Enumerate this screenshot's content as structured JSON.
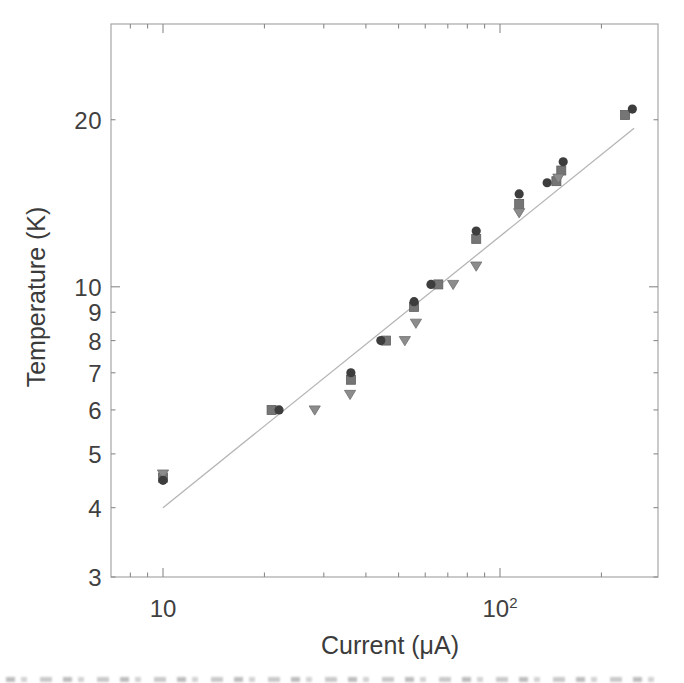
{
  "figure": {
    "xlabel": "Current (μA)",
    "ylabel": "Temperature (K)",
    "background_color": "#ffffff",
    "text_color": "#3b3b3b",
    "spine_color": "#9e9e9e",
    "tick_color": "#8a8a8a"
  },
  "axes": {
    "x": {
      "scale": "log",
      "major_ticks": [
        10,
        100
      ],
      "minor_ticks": [
        8,
        9,
        20,
        30,
        40,
        50,
        60,
        70,
        80,
        90,
        200
      ],
      "tick_labels": [
        {
          "value": 10,
          "text": "10",
          "sup": ""
        },
        {
          "value": 100,
          "text": "10",
          "sup": "2"
        }
      ]
    },
    "y": {
      "scale": "log",
      "major_ticks": [
        10
      ],
      "minor_ticks": [
        3,
        4,
        5,
        6,
        7,
        8,
        9,
        20
      ],
      "tick_labels": [
        {
          "value": 20,
          "text": "20"
        },
        {
          "value": 10,
          "text": "10"
        },
        {
          "value": 9,
          "text": "9"
        },
        {
          "value": 8,
          "text": "8"
        },
        {
          "value": 7,
          "text": "7"
        },
        {
          "value": 6,
          "text": "6"
        },
        {
          "value": 5,
          "text": "5"
        },
        {
          "value": 4,
          "text": "4"
        },
        {
          "value": 3,
          "text": "3"
        }
      ]
    }
  },
  "chart_data": {
    "type": "scatter",
    "title": "",
    "xlabel": "Current (μA)",
    "ylabel": "Temperature (K)",
    "x_scale": "log",
    "y_scale": "log",
    "xlim": [
      7,
      300
    ],
    "ylim": [
      3,
      30
    ],
    "grid": false,
    "legend": "none",
    "series": [
      {
        "name": "circle-markers",
        "marker": "circle",
        "color": "#3d3d3d",
        "points": [
          [
            10.0,
            4.48
          ],
          [
            22.1,
            6.0
          ],
          [
            36.1,
            7.0
          ],
          [
            44.3,
            8.0
          ],
          [
            55.6,
            9.4
          ],
          [
            62.4,
            10.1
          ],
          [
            85.0,
            12.6
          ],
          [
            114.0,
            14.7
          ],
          [
            138.0,
            15.4
          ],
          [
            154.0,
            16.8
          ],
          [
            247.0,
            20.9
          ]
        ]
      },
      {
        "name": "square-markers",
        "marker": "square",
        "color": "#757575",
        "points": [
          [
            10.0,
            4.53
          ],
          [
            21.0,
            6.0
          ],
          [
            36.1,
            6.8
          ],
          [
            45.9,
            8.0
          ],
          [
            55.6,
            9.2
          ],
          [
            65.6,
            10.1
          ],
          [
            85.0,
            12.2
          ],
          [
            114.0,
            14.1
          ],
          [
            147.0,
            15.5
          ],
          [
            152.0,
            16.2
          ],
          [
            235.0,
            20.4
          ]
        ]
      },
      {
        "name": "triangle-down-markers",
        "marker": "triangle-down",
        "color": "#8c8c8c",
        "points": [
          [
            10.0,
            4.6
          ],
          [
            28.2,
            6.0
          ],
          [
            35.9,
            6.4
          ],
          [
            52.2,
            8.0
          ],
          [
            56.3,
            8.6
          ],
          [
            72.6,
            10.1
          ],
          [
            85.0,
            10.9
          ],
          [
            114.0,
            13.6
          ],
          [
            149.0,
            15.7
          ]
        ]
      }
    ],
    "fit_line": {
      "name": "power-law-fit",
      "color": "#b5b5b5",
      "points": [
        [
          10.0,
          4.0
        ],
        [
          250.0,
          19.3
        ]
      ]
    }
  }
}
